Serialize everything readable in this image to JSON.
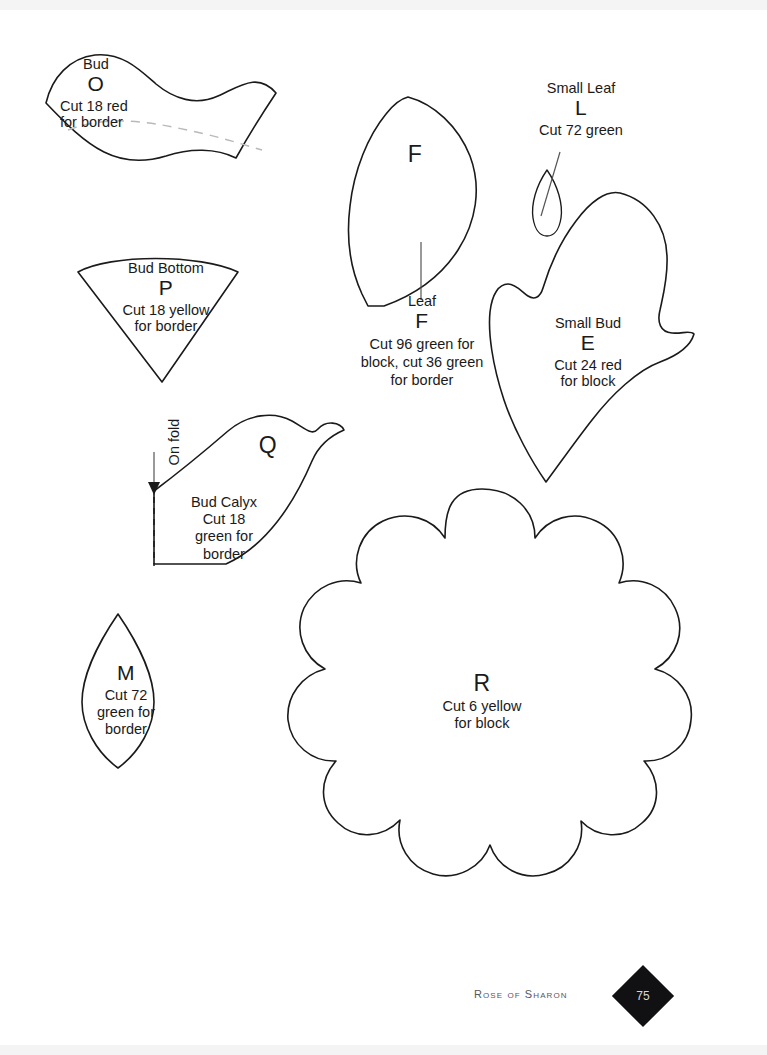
{
  "page": {
    "title": "Rose of Sharon",
    "number": "75",
    "background": "#ffffff",
    "ink": "#1a1a1a",
    "seam_color": "#b9b9b9",
    "badge_color": "#111114"
  },
  "pieces": [
    {
      "id": "O",
      "name": "Bud",
      "letter": "O",
      "cut": "Cut 18 red\nfor border",
      "cut_line_1": "Cut 18 red",
      "cut_line_2": "for border",
      "has_seam_dash": true
    },
    {
      "id": "P",
      "name": "Bud Bottom",
      "letter": "P",
      "cut_line_1": "Cut 18 yellow",
      "cut_line_2": "for border"
    },
    {
      "id": "Q",
      "name": "Bud Calyx",
      "letter": "Q",
      "cut": "Cut 18 green for border",
      "cut_line_1": "Cut 18",
      "cut_line_2": "green for",
      "cut_line_3": "border",
      "fold_label": "On fold"
    },
    {
      "id": "M",
      "name": "",
      "letter": "M",
      "cut_line_1": "Cut 72",
      "cut_line_2": "green for",
      "cut_line_3": "border"
    },
    {
      "id": "F",
      "name": "Leaf",
      "letter": "F",
      "letter_inside": "F",
      "cut": "Cut 96 green for block, cut 36 green for border"
    },
    {
      "id": "L",
      "name": "Small Leaf",
      "letter": "L",
      "cut": "Cut 72 green"
    },
    {
      "id": "E",
      "name": "Small Bud",
      "letter": "E",
      "cut_line_1": "Cut 24 red",
      "cut_line_2": "for block"
    },
    {
      "id": "R",
      "name": "",
      "letter": "R",
      "cut_line_1": "Cut 6 yellow",
      "cut_line_2": "for block"
    }
  ]
}
